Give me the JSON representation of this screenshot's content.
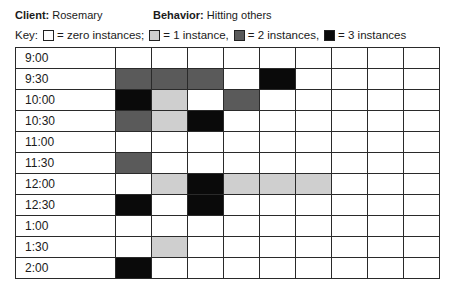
{
  "header": {
    "client_label": "Client:",
    "client_value": "Rosemary",
    "behavior_label": "Behavior:",
    "behavior_value": "Hitting others"
  },
  "key": {
    "prefix": "Key:",
    "items": [
      {
        "level": 0,
        "label": "= zero instances;",
        "color": "#ffffff"
      },
      {
        "level": 1,
        "label": "= 1 instance,",
        "color": "#cfcfcf"
      },
      {
        "level": 2,
        "label": "= 2 instances,",
        "color": "#5a5a5a"
      },
      {
        "level": 3,
        "label": "= 3 instances",
        "color": "#0a0a0a"
      }
    ]
  },
  "chart_data": {
    "type": "heatmap",
    "legend": {
      "0": "zero instances",
      "1": "1 instance",
      "2": "2 instances",
      "3": "3 instances"
    },
    "rows": [
      "9:00",
      "9:30",
      "10:00",
      "10:30",
      "11:00",
      "11:30",
      "12:00",
      "12:30",
      "1:00",
      "1:30",
      "2:00"
    ],
    "columns": [
      1,
      2,
      3,
      4,
      5,
      6,
      7,
      8,
      9
    ],
    "values": [
      [
        0,
        0,
        0,
        0,
        0,
        0,
        0,
        0,
        0
      ],
      [
        2,
        2,
        2,
        0,
        3,
        0,
        0,
        0,
        0
      ],
      [
        3,
        1,
        0,
        2,
        0,
        0,
        0,
        0,
        0
      ],
      [
        2,
        1,
        3,
        0,
        0,
        0,
        0,
        0,
        0
      ],
      [
        0,
        0,
        0,
        0,
        0,
        0,
        0,
        0,
        0
      ],
      [
        2,
        0,
        0,
        0,
        0,
        0,
        0,
        0,
        0
      ],
      [
        0,
        1,
        3,
        1,
        1,
        1,
        0,
        0,
        0
      ],
      [
        3,
        0,
        3,
        0,
        0,
        0,
        0,
        0,
        0
      ],
      [
        0,
        0,
        0,
        0,
        0,
        0,
        0,
        0,
        0
      ],
      [
        0,
        1,
        0,
        0,
        0,
        0,
        0,
        0,
        0
      ],
      [
        3,
        0,
        0,
        0,
        0,
        0,
        0,
        0,
        0
      ]
    ]
  }
}
